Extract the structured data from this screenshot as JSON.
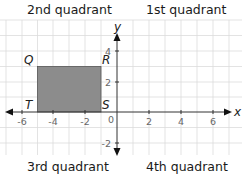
{
  "quadrant_labels": {
    "q2": "2nd quadrant",
    "q1": "1st quadrant",
    "q3": "3rd quadrant",
    "q4": "4th quadrant"
  },
  "axes": {
    "x_label": "x",
    "y_label": "y",
    "origin_label": "0",
    "x_ticks": [
      "-6",
      "-4",
      "-2",
      "2",
      "4",
      "6"
    ],
    "y_ticks": [
      "4",
      "2",
      "-2"
    ]
  },
  "rectangle": {
    "fill": "#8c8c8c",
    "vertices": [
      {
        "name": "Q",
        "x": -5,
        "y": 3
      },
      {
        "name": "R",
        "x": -1,
        "y": 3
      },
      {
        "name": "S",
        "x": -1,
        "y": 0
      },
      {
        "name": "T",
        "x": -5,
        "y": 0
      }
    ]
  },
  "labels": {
    "Q": "Q",
    "R": "R",
    "S": "S",
    "T": "T"
  }
}
